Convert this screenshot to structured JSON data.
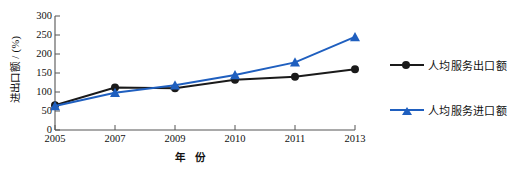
{
  "chart_data": {
    "type": "line",
    "title": "",
    "xlabel": "年 份",
    "ylabel": "进出口额 / (%)",
    "categories": [
      "2005",
      "2007",
      "2009",
      "2010",
      "2011",
      "2013"
    ],
    "x": [
      2005,
      2007,
      2009,
      2010,
      2011,
      2013
    ],
    "xlim": [
      2005,
      2013
    ],
    "ylim": [
      0,
      300
    ],
    "yticks": [
      0,
      50,
      100,
      150,
      200,
      250,
      300
    ],
    "xticks": [
      "2005",
      "2007",
      "2009",
      "2010",
      "2011",
      "2013"
    ],
    "grid": false,
    "legend_position": "right",
    "series": [
      {
        "name": "人均服务出口额",
        "color": "#1a1a1a",
        "marker": "circle",
        "values": [
          65,
          112,
          110,
          132,
          140,
          160
        ]
      },
      {
        "name": "人均服务进口额",
        "color": "#1f5fbf",
        "marker": "triangle",
        "values": [
          63,
          98,
          118,
          145,
          178,
          245
        ]
      }
    ]
  },
  "axes": {
    "y_label": "进出口额 / (%)",
    "x_label": "年 份",
    "y_ticks": [
      "300",
      "250",
      "200",
      "150",
      "100",
      "50",
      "0"
    ],
    "x_ticks": [
      "2005",
      "2007",
      "2009",
      "2010",
      "2011",
      "2013"
    ]
  },
  "legend": {
    "items": [
      {
        "label": "人均服务出口额",
        "color": "#1a1a1a",
        "marker": "circle-marker"
      },
      {
        "label": "人均服务进口额",
        "color": "#1f5fbf",
        "marker": "triangle-marker"
      }
    ]
  },
  "colors": {
    "export_series": "#1a1a1a",
    "import_series": "#1f5fbf",
    "axis": "#555555",
    "background": "#ffffff"
  }
}
